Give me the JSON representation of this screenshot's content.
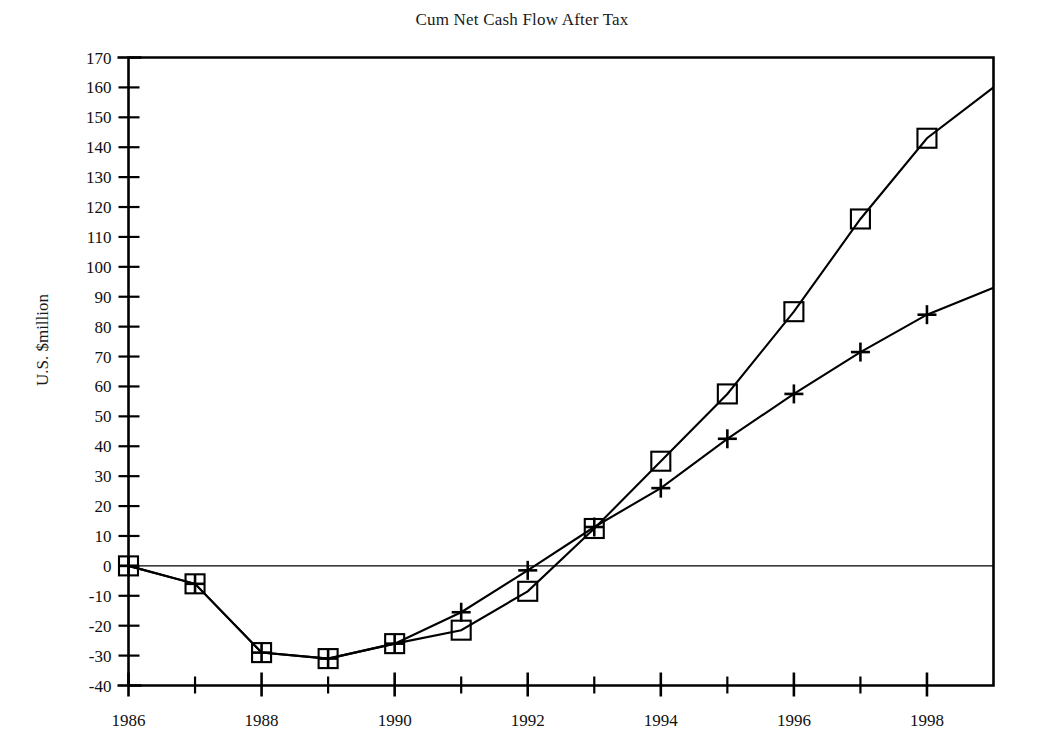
{
  "chart_data": {
    "type": "line",
    "title": "Cum Net Cash Flow After Tax",
    "xlabel": "",
    "ylabel": "U.S. $million",
    "xlim": [
      1986,
      1999
    ],
    "ylim": [
      -40,
      170
    ],
    "ytick_step": 10,
    "yticks": [
      -40,
      -30,
      -20,
      -10,
      0,
      10,
      20,
      30,
      40,
      50,
      60,
      70,
      80,
      90,
      100,
      110,
      120,
      130,
      140,
      150,
      160,
      170
    ],
    "ytick_labels": [
      "-40",
      "-30",
      "-20",
      "-10",
      "0",
      "10",
      "20",
      "30",
      "40",
      "50",
      "60",
      "70",
      "80",
      "90",
      "100",
      "110",
      "120",
      "130",
      "140",
      "150",
      "160",
      "170"
    ],
    "xticks_major": [
      1986,
      1988,
      1990,
      1992,
      1994,
      1996,
      1998
    ],
    "xtick_labels": [
      "1986",
      "1988",
      "1990",
      "1992",
      "1994",
      "1996",
      "1998"
    ],
    "xticks_minor": [
      1987,
      1989,
      1991,
      1993,
      1995,
      1997
    ],
    "grid": false,
    "zero_line": true,
    "legend": "none",
    "x": [
      1986,
      1987,
      1988,
      1989,
      1990,
      1991,
      1992,
      1993,
      1994,
      1995,
      1996,
      1997,
      1998,
      1999
    ],
    "series": [
      {
        "name": "square-series",
        "marker": "square",
        "color": "#000000",
        "values": [
          0,
          -6,
          -29,
          -31,
          -26,
          -21.5,
          -8.5,
          12.5,
          35,
          57.5,
          85,
          116,
          143,
          160
        ],
        "marker_last_index": 12
      },
      {
        "name": "plus-series",
        "marker": "plus",
        "color": "#000000",
        "values": [
          0,
          -6,
          -29,
          -31,
          -26,
          -15.5,
          -1.5,
          13,
          26,
          42.5,
          57.5,
          71.5,
          84,
          93
        ],
        "marker_last_index": 12
      }
    ]
  },
  "axes": {
    "title": "Cum Net Cash Flow After Tax",
    "y_axis_title": "U.S. $million"
  }
}
